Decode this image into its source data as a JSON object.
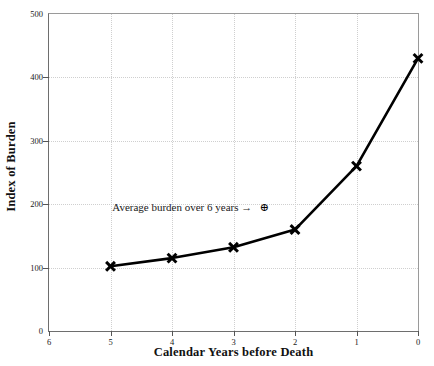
{
  "chart_data": {
    "type": "line",
    "title": "",
    "xlabel": "Calendar Years before Death",
    "ylabel": "Index of Burden",
    "xlim": [
      6,
      0
    ],
    "ylim": [
      0,
      500
    ],
    "x_reversed": true,
    "grid": true,
    "legend": "none",
    "x_ticks": [
      "6",
      "5",
      "4",
      "3",
      "2",
      "1",
      "0"
    ],
    "x_tick_values": [
      6,
      5,
      4,
      3,
      2,
      1,
      0
    ],
    "y_ticks": [
      "0",
      "100",
      "200",
      "300",
      "400",
      "500"
    ],
    "y_tick_values": [
      0,
      100,
      200,
      300,
      400,
      500
    ],
    "series": [
      {
        "name": "Index of Burden",
        "marker": "x",
        "color": "#000000",
        "x": [
          5,
          4,
          3,
          2,
          1,
          0
        ],
        "values": [
          102,
          115,
          132,
          160,
          260,
          430
        ]
      }
    ],
    "annotations": [
      {
        "text": "Average burden over 6 years →",
        "marker": "⊕",
        "marker_name": "circled-plus-marker",
        "x": 2.5,
        "y": 196
      }
    ]
  }
}
